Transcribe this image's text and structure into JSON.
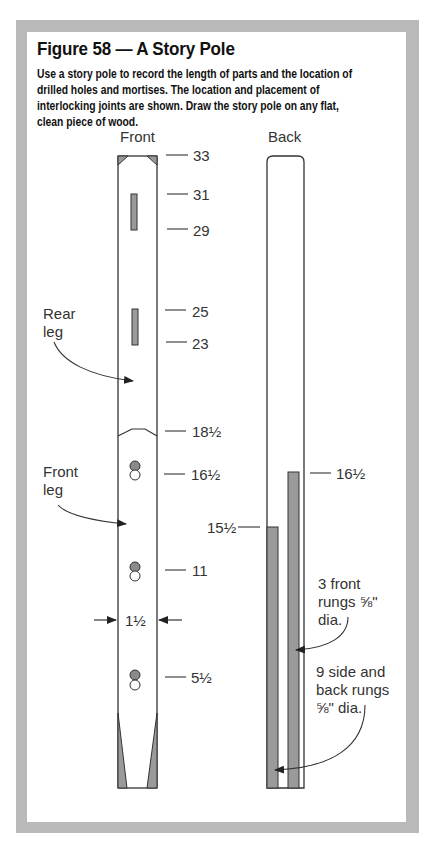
{
  "figure": {
    "title": "Figure 58 — A Story Pole",
    "description": "Use a story pole to record the length of parts and the location of drilled holes and mortises. The location and placement of interlocking joints are shown. Draw the story pole on any flat, clean piece of wood."
  },
  "colors": {
    "frame": "#b9b9b9",
    "fill_gray": "#9a9a9a",
    "outline": "#333333"
  },
  "front_pole": {
    "label": "Front",
    "marks": [
      {
        "id": "m33",
        "label": "33"
      },
      {
        "id": "m31",
        "label": "31"
      },
      {
        "id": "m29",
        "label": "29"
      },
      {
        "id": "m25",
        "label": "25"
      },
      {
        "id": "m23",
        "label": "23"
      },
      {
        "id": "m18h",
        "label": "18½"
      },
      {
        "id": "m16h",
        "label": "16½"
      },
      {
        "id": "m11",
        "label": "11"
      },
      {
        "id": "m5h",
        "label": "5½"
      }
    ],
    "width_label": "1½",
    "callouts": {
      "rear_leg_line1": "Rear",
      "rear_leg_line2": "leg",
      "front_leg_line1": "Front",
      "front_leg_line2": "leg"
    }
  },
  "back_pole": {
    "label": "Back",
    "marks": [
      {
        "id": "b16h",
        "label": "16½"
      },
      {
        "id": "b15h",
        "label": "15½"
      }
    ],
    "callouts": {
      "front_rungs_line1": "3 front",
      "front_rungs_line2": "rungs ⅝\"",
      "front_rungs_line3": "dia.",
      "side_rungs_line1": "9 side and",
      "side_rungs_line2": "back rungs",
      "side_rungs_line3": "⅝\" dia."
    }
  }
}
